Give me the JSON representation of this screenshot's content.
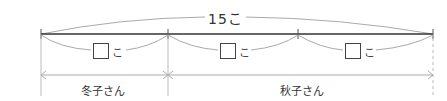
{
  "diagram": {
    "type": "tape-diagram",
    "total": {
      "value": "15",
      "unit": "こ",
      "label": "15こ"
    },
    "segments": [
      {
        "placeholder": "□",
        "unit": "こ"
      },
      {
        "placeholder": "□",
        "unit": "こ"
      },
      {
        "placeholder": "□",
        "unit": "こ"
      }
    ],
    "people": [
      {
        "name": "冬子さん",
        "span_segments": 1
      },
      {
        "name": "秋子さん",
        "span_segments": 2
      }
    ],
    "colors": {
      "main_line": "#333333",
      "brace": "#aaaaaa",
      "text": "#333333"
    }
  }
}
